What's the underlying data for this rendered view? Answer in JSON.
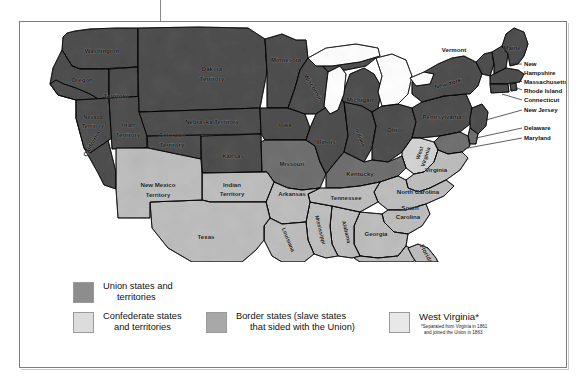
{
  "figure": {
    "kind": "thematic-map"
  },
  "map": {
    "regions": [
      {
        "id": "washington-territory",
        "label_line1": "Washington",
        "label_line2": "Territory",
        "category": "union"
      },
      {
        "id": "oregon",
        "label_line1": "Oregon",
        "category": "union"
      },
      {
        "id": "california",
        "label_line1": "California",
        "category": "union"
      },
      {
        "id": "nevada-territory",
        "label_line1": "Nevada",
        "label_line2": "Territory",
        "category": "union"
      },
      {
        "id": "utah-territory",
        "label_line1": "Utah",
        "label_line2": "Territory",
        "category": "union"
      },
      {
        "id": "colorado-territory",
        "label_line1": "Colorado",
        "label_line2": "Territory",
        "category": "union"
      },
      {
        "id": "dakota-territory",
        "label_line1": "Dakota",
        "label_line2": "Territory",
        "category": "union"
      },
      {
        "id": "nebraska-territory",
        "label_line1": "Nebraska Territory",
        "category": "union"
      },
      {
        "id": "kansas",
        "label_line1": "Kansas",
        "category": "union"
      },
      {
        "id": "minnesota",
        "label_line1": "Minnesota",
        "category": "union"
      },
      {
        "id": "iowa",
        "label_line1": "Iowa",
        "category": "union"
      },
      {
        "id": "wisconsin",
        "label_line1": "Wisconsin",
        "category": "union"
      },
      {
        "id": "michigan",
        "label_line1": "Michigan",
        "category": "union"
      },
      {
        "id": "illinois",
        "label_line1": "Illinois",
        "category": "union"
      },
      {
        "id": "indiana",
        "label_line1": "Indiana",
        "category": "union"
      },
      {
        "id": "ohio",
        "label_line1": "Ohio",
        "category": "union"
      },
      {
        "id": "pennsylvania",
        "label_line1": "Pennsylvania",
        "category": "union"
      },
      {
        "id": "new-york",
        "label_line1": "New York",
        "category": "union"
      },
      {
        "id": "vermont",
        "label_line1": "Vermont",
        "category": "union"
      },
      {
        "id": "maine",
        "label_line1": "Maine",
        "category": "union"
      },
      {
        "id": "new-hampshire",
        "label_line1": "New",
        "label_line2": "Hampshire",
        "category": "union"
      },
      {
        "id": "massachusetts",
        "label_line1": "Massachusetts",
        "category": "union"
      },
      {
        "id": "rhode-island",
        "label_line1": "Rhode Island",
        "category": "union"
      },
      {
        "id": "connecticut",
        "label_line1": "Connecticut",
        "category": "union"
      },
      {
        "id": "new-jersey",
        "label_line1": "New Jersey",
        "category": "union"
      },
      {
        "id": "delaware",
        "label_line1": "Delaware",
        "category": "border"
      },
      {
        "id": "maryland",
        "label_line1": "Maryland",
        "category": "border"
      },
      {
        "id": "west-virginia",
        "label_line1": "West",
        "label_line2": "Virginia",
        "category": "west-virginia"
      },
      {
        "id": "missouri",
        "label_line1": "Missouri",
        "category": "border"
      },
      {
        "id": "kentucky",
        "label_line1": "Kentucky",
        "category": "border"
      },
      {
        "id": "virginia",
        "label_line1": "Virginia",
        "category": "confederate"
      },
      {
        "id": "north-carolina",
        "label_line1": "North Carolina",
        "category": "confederate"
      },
      {
        "id": "south-carolina",
        "label_line1": "South",
        "label_line2": "Carolina",
        "category": "confederate"
      },
      {
        "id": "georgia",
        "label_line1": "Georgia",
        "category": "confederate"
      },
      {
        "id": "florida",
        "label_line1": "Florida",
        "category": "confederate"
      },
      {
        "id": "alabama",
        "label_line1": "Alabama",
        "category": "confederate"
      },
      {
        "id": "mississippi",
        "label_line1": "Mississippi",
        "category": "confederate"
      },
      {
        "id": "tennessee",
        "label_line1": "Tennessee",
        "category": "confederate"
      },
      {
        "id": "arkansas",
        "label_line1": "Arkansas",
        "category": "confederate"
      },
      {
        "id": "louisiana",
        "label_line1": "Louisiana",
        "category": "confederate"
      },
      {
        "id": "texas",
        "label_line1": "Texas",
        "category": "confederate"
      },
      {
        "id": "indian-territory",
        "label_line1": "Indian",
        "label_line2": "Territory",
        "category": "confederate"
      },
      {
        "id": "new-mexico-territory",
        "label_line1": "New Mexico",
        "label_line2": "Territory",
        "category": "confederate"
      }
    ]
  },
  "legend": {
    "items": [
      {
        "id": "union",
        "line1": "Union states and",
        "line2": "territories",
        "color": "#8d8d8d"
      },
      {
        "id": "confederate",
        "line1": "Confederate states",
        "line2": "and territories",
        "color": "#dcdcdc"
      },
      {
        "id": "border",
        "line1": "Border states (slave states",
        "line2": "that sided with the Union)",
        "color": "#a8a8a8"
      },
      {
        "id": "west-virginia",
        "title": "West Virginia*",
        "note_line1": "*Separated from Virginia in 1861",
        "note_line2": "and joined the Union in 1863",
        "color": "#e8e8e8"
      }
    ]
  },
  "colors": {
    "union": "#8d8d8d",
    "confederate": "#dcdcdc",
    "border": "#a8a8a8",
    "west_virginia": "#e8e8e8",
    "outline": "#1a1a1a",
    "frame": "#7d7d7d",
    "lake": "#ffffff"
  }
}
